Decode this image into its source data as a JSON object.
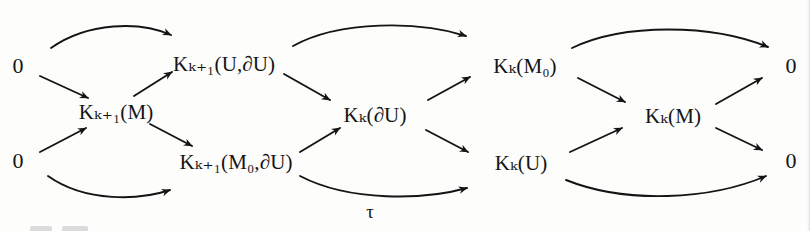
{
  "diagram": {
    "background_color": "#fdfdfc",
    "ink_color": "#141414",
    "nodes": [
      {
        "id": "zero_tl",
        "text": "0",
        "x": 18,
        "y": 66,
        "kind": "zero"
      },
      {
        "id": "zero_bl",
        "text": "0",
        "x": 18,
        "y": 161,
        "kind": "zero"
      },
      {
        "id": "kk1_M",
        "text": "Kₖ₊₁(M)",
        "x": 116,
        "y": 112,
        "kind": "term"
      },
      {
        "id": "kk1_UdU",
        "text": "Kₖ₊₁(U,∂U)",
        "x": 224,
        "y": 64,
        "kind": "term"
      },
      {
        "id": "kk1_M0dU",
        "text": "Kₖ₊₁(M₀,∂U)",
        "x": 236,
        "y": 162,
        "kind": "term"
      },
      {
        "id": "kk_dU",
        "text": "Kₖ(∂U)",
        "x": 375,
        "y": 115,
        "kind": "term"
      },
      {
        "id": "kk_M0",
        "text": "Kₖ(M₀)",
        "x": 525,
        "y": 66,
        "kind": "term"
      },
      {
        "id": "kk_U",
        "text": "Kₖ(U)",
        "x": 521,
        "y": 163,
        "kind": "term"
      },
      {
        "id": "kk_M",
        "text": "Kₖ(M)",
        "x": 673,
        "y": 116,
        "kind": "term"
      },
      {
        "id": "zero_tr",
        "text": "0",
        "x": 791,
        "y": 66,
        "kind": "zero"
      },
      {
        "id": "zero_br",
        "text": "0",
        "x": 791,
        "y": 161,
        "kind": "zero"
      }
    ],
    "edge_labels": [
      {
        "id": "tau",
        "text": "τ",
        "x": 370,
        "y": 211
      }
    ],
    "arrows": [
      {
        "id": "a1",
        "from": "zero_tl",
        "to": "kk1_UdU",
        "style": "arc",
        "note": "0 to K_{k+1}(U,dU)"
      },
      {
        "id": "a2",
        "from": "zero_tl",
        "to": "kk1_M",
        "style": "straight",
        "note": "0 to K_{k+1}(M)"
      },
      {
        "id": "a3",
        "from": "zero_bl",
        "to": "kk1_M",
        "style": "straight",
        "note": "0 to K_{k+1}(M)"
      },
      {
        "id": "a4",
        "from": "zero_bl",
        "to": "kk1_M0dU",
        "style": "arc",
        "note": "0 to K_{k+1}(M0,dU)"
      },
      {
        "id": "a5",
        "from": "kk1_M",
        "to": "kk1_UdU",
        "style": "straight",
        "note": "K_{k+1}(M) to K_{k+1}(U,dU)"
      },
      {
        "id": "a6",
        "from": "kk1_M",
        "to": "kk1_M0dU",
        "style": "straight",
        "note": "K_{k+1}(M) to K_{k+1}(M0,dU)"
      },
      {
        "id": "a7",
        "from": "kk1_UdU",
        "to": "kk_dU",
        "style": "straight",
        "note": "K_{k+1}(U,dU) to K_k(dU)"
      },
      {
        "id": "a8",
        "from": "kk1_M0dU",
        "to": "kk_dU",
        "style": "straight",
        "note": "K_{k+1}(M0,dU) to K_k(dU)"
      },
      {
        "id": "a9",
        "from": "kk1_UdU",
        "to": "kk_M0",
        "style": "arc",
        "note": "K_{k+1}(U,dU) to K_k(M0)"
      },
      {
        "id": "a10",
        "from": "kk1_M0dU",
        "to": "kk_U",
        "style": "arc",
        "label": "tau",
        "note": "tau map to K_k(U)"
      },
      {
        "id": "a11",
        "from": "kk_dU",
        "to": "kk_M0",
        "style": "straight",
        "note": "K_k(dU) to K_k(M0)"
      },
      {
        "id": "a12",
        "from": "kk_dU",
        "to": "kk_U",
        "style": "straight",
        "note": "K_k(dU) to K_k(U)"
      },
      {
        "id": "a13",
        "from": "kk_M0",
        "to": "kk_M",
        "style": "straight",
        "note": "K_k(M0) to K_k(M)"
      },
      {
        "id": "a14",
        "from": "kk_U",
        "to": "kk_M",
        "style": "straight",
        "note": "K_k(U) to K_k(M)"
      },
      {
        "id": "a15",
        "from": "kk_M0",
        "to": "zero_tr",
        "style": "arc",
        "note": "K_k(M0) to 0"
      },
      {
        "id": "a16",
        "from": "kk_M",
        "to": "zero_tr",
        "style": "straight",
        "note": "K_k(M) to 0"
      },
      {
        "id": "a17",
        "from": "kk_M",
        "to": "zero_br",
        "style": "straight",
        "note": "K_k(M) to 0"
      },
      {
        "id": "a18",
        "from": "kk_U",
        "to": "zero_br",
        "style": "arc",
        "note": "K_k(U) to 0"
      }
    ]
  }
}
